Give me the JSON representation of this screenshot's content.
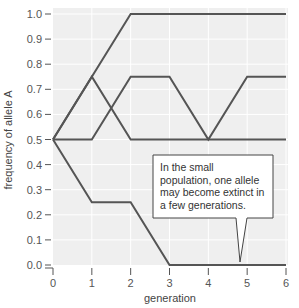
{
  "chart_data": {
    "type": "line",
    "title": "",
    "xlabel": "generation",
    "ylabel": "frequency of allele A",
    "x": [
      0,
      1,
      2,
      3,
      4,
      5,
      6
    ],
    "xlim": [
      0,
      6
    ],
    "ylim": [
      0.0,
      1.0
    ],
    "x_ticks": [
      "0",
      "1",
      "2",
      "3",
      "4",
      "5",
      "6"
    ],
    "y_ticks": [
      "0.0",
      "0.1",
      "0.2",
      "0.3",
      "0.4",
      "0.5",
      "0.6",
      "0.7",
      "0.8",
      "0.9",
      "1.0"
    ],
    "grid": true,
    "legend": null,
    "series": [
      {
        "name": "population 1",
        "values": [
          0.5,
          0.75,
          1.0,
          1.0,
          1.0,
          1.0,
          1.0
        ]
      },
      {
        "name": "population 2",
        "values": [
          0.5,
          0.75,
          0.5,
          0.5,
          0.5,
          0.5,
          0.5
        ]
      },
      {
        "name": "population 3",
        "values": [
          0.5,
          0.5,
          0.75,
          0.75,
          0.5,
          0.75,
          0.75
        ]
      },
      {
        "name": "population 4",
        "values": [
          0.5,
          0.25,
          0.25,
          0.0,
          0.0,
          0.0,
          0.0
        ]
      }
    ],
    "annotations": [
      {
        "text": "In the small population, one allele may become extinct in a few generations.",
        "points_to": {
          "x": 4.8,
          "y": 0.0
        }
      }
    ]
  },
  "colors": {
    "plot_background": "#efefef",
    "gridline": "#ffffff",
    "line": "#555555",
    "axis": "#555555"
  },
  "labels": {
    "xlabel": "generation",
    "ylabel": "frequency of allele A",
    "callout": "In the small population, one allele may become extinct in a few generations."
  }
}
